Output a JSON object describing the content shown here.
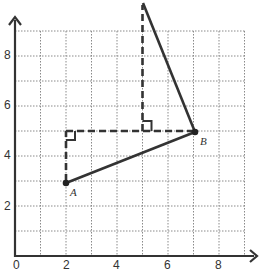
{
  "diagram": {
    "x_ticks": [
      "0",
      "2",
      "4",
      "6",
      "8"
    ],
    "y_ticks": [
      "2",
      "4",
      "6",
      "8"
    ],
    "grid": {
      "x_min": 0,
      "x_max": 9,
      "y_min": 0,
      "y_max": 9,
      "step": 1
    },
    "points": {
      "A": {
        "label": "A",
        "x": 2,
        "y": 3
      },
      "B": {
        "label": "B",
        "x": 7,
        "y": 5
      },
      "C": {
        "label": "",
        "x": 5,
        "y": 10
      }
    },
    "segments": [
      {
        "from": "A",
        "to": "B",
        "style": "solid"
      },
      {
        "from": "B",
        "to": "C",
        "style": "solid"
      },
      {
        "from": [
          2,
          3
        ],
        "to": [
          2,
          5
        ],
        "style": "dashed"
      },
      {
        "from": [
          2,
          5
        ],
        "to": [
          7,
          5
        ],
        "style": "dashed"
      },
      {
        "from": [
          5,
          5
        ],
        "to": [
          5,
          10
        ],
        "style": "dashed"
      }
    ],
    "right_angle_markers": [
      [
        2,
        5
      ],
      [
        5,
        5
      ]
    ],
    "colors": {
      "line": "#333333",
      "grid": "#888888"
    }
  }
}
